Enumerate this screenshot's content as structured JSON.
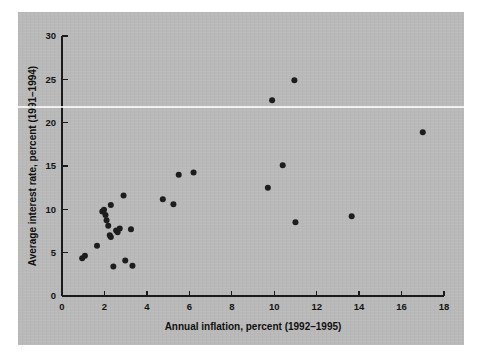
{
  "figure": {
    "background_color": "#ffffff",
    "panel_color": "#b9b9b9",
    "marker_color": "#1d1d1d",
    "axis_color": "#1b1b1b"
  },
  "chart_data": {
    "type": "scatter",
    "title": "",
    "xlabel": "Annual inflation, percent (1992–1995)",
    "ylabel": "Average interest rate, percent (1991–1994)",
    "xlim": [
      0,
      18
    ],
    "ylim": [
      0,
      30
    ],
    "xticks": [
      0,
      2,
      4,
      6,
      8,
      10,
      12,
      14,
      16,
      18
    ],
    "yticks": [
      0,
      5,
      10,
      15,
      20,
      25,
      30
    ],
    "xtick_labels": [
      "0",
      "2",
      "4",
      "6",
      "8",
      "10",
      "12",
      "14",
      "16",
      "18"
    ],
    "ytick_labels": [
      "0",
      "5",
      "10",
      "15",
      "20",
      "25",
      "30"
    ],
    "grid": false,
    "legend": null,
    "series": [
      {
        "name": "countries",
        "marker": "circle",
        "points": [
          [
            0.95,
            4.35
          ],
          [
            1.08,
            4.65
          ],
          [
            1.65,
            5.8
          ],
          [
            1.9,
            9.75
          ],
          [
            1.98,
            9.95
          ],
          [
            2.05,
            9.35
          ],
          [
            2.1,
            8.75
          ],
          [
            2.3,
            10.5
          ],
          [
            2.18,
            8.1
          ],
          [
            2.25,
            7.0
          ],
          [
            2.3,
            6.8
          ],
          [
            2.42,
            3.4
          ],
          [
            2.55,
            7.55
          ],
          [
            2.62,
            7.35
          ],
          [
            2.72,
            7.8
          ],
          [
            2.9,
            11.6
          ],
          [
            2.98,
            4.1
          ],
          [
            3.25,
            7.7
          ],
          [
            3.32,
            3.5
          ],
          [
            4.75,
            11.15
          ],
          [
            5.25,
            10.6
          ],
          [
            5.5,
            14.0
          ],
          [
            6.2,
            14.25
          ],
          [
            9.7,
            12.5
          ],
          [
            9.9,
            22.6
          ],
          [
            10.4,
            15.1
          ],
          [
            10.95,
            24.9
          ],
          [
            11.0,
            8.5
          ],
          [
            13.65,
            9.2
          ],
          [
            17.0,
            18.9
          ]
        ]
      }
    ]
  }
}
